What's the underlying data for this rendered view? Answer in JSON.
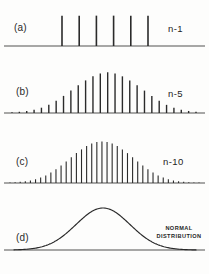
{
  "figure": {
    "background_color": "#fdfdfc",
    "ink_color": "#2a2a2a",
    "baseline_color": "#8a8a8a"
  },
  "panels": [
    {
      "key": "a",
      "label": "(a)",
      "n_label": "n-1",
      "caption": null
    },
    {
      "key": "b",
      "label": "(b)",
      "n_label": "n-5",
      "caption": null
    },
    {
      "key": "c",
      "label": "(c)",
      "n_label": "n-10",
      "caption": null
    },
    {
      "key": "d",
      "label": "(d)",
      "n_label": null,
      "caption_line1": "NORMAL",
      "caption_line2": "DISTRIBUTION"
    }
  ],
  "chart_data": [
    {
      "type": "bar",
      "title": "(a) n-1",
      "panel": "a",
      "xlabel": "",
      "ylabel": "",
      "grid": false,
      "legend": null,
      "axis": {
        "baseline": true,
        "ticks": false,
        "tick_labels": false
      },
      "x": [
        1,
        2,
        3,
        4,
        5,
        6
      ],
      "categories": [
        "1",
        "2",
        "3",
        "4",
        "5",
        "6"
      ],
      "values": [
        1.0,
        1.0,
        1.0,
        1.0,
        1.0,
        1.0
      ],
      "ylim": [
        0,
        1.12
      ],
      "bar_width_px": 1.6,
      "x_start_px": 62,
      "x_end_px": 148,
      "note": "Six equal-height spikes: uniform parent distribution for a single observation"
    },
    {
      "type": "bar",
      "title": "(b) n-5",
      "panel": "b",
      "xlabel": "",
      "ylabel": "",
      "grid": false,
      "legend": null,
      "axis": {
        "baseline": true,
        "ticks": false,
        "tick_labels": false
      },
      "x": [
        1,
        2,
        3,
        4,
        5,
        6,
        7,
        8,
        9,
        10,
        11,
        12,
        13,
        14,
        15,
        16,
        17,
        18,
        19,
        20,
        21,
        22,
        23,
        24,
        25,
        26
      ],
      "values": [
        0.02,
        0.03,
        0.05,
        0.08,
        0.13,
        0.2,
        0.3,
        0.42,
        0.55,
        0.68,
        0.8,
        0.9,
        0.97,
        1.0,
        0.97,
        0.9,
        0.8,
        0.68,
        0.55,
        0.42,
        0.3,
        0.2,
        0.13,
        0.08,
        0.05,
        0.03
      ],
      "ylim": [
        0,
        1.08
      ],
      "bar_width_px": 1.4,
      "x_start_px": 12,
      "x_end_px": 196,
      "note": "Sum of 5 observations: discrete bell-shaped distribution"
    },
    {
      "type": "bar",
      "title": "(c) n-10",
      "panel": "c",
      "xlabel": "",
      "ylabel": "",
      "grid": false,
      "legend": null,
      "axis": {
        "baseline": true,
        "ticks": false,
        "tick_labels": false
      },
      "x": [
        1,
        2,
        3,
        4,
        5,
        6,
        7,
        8,
        9,
        10,
        11,
        12,
        13,
        14,
        15,
        16,
        17,
        18,
        19,
        20,
        21,
        22,
        23,
        24,
        25,
        26,
        27,
        28,
        29,
        30,
        31,
        32,
        33,
        34,
        35,
        36,
        37,
        38
      ],
      "values": [
        0.015,
        0.02,
        0.03,
        0.04,
        0.06,
        0.09,
        0.13,
        0.18,
        0.25,
        0.33,
        0.42,
        0.52,
        0.62,
        0.72,
        0.81,
        0.89,
        0.95,
        0.99,
        1.0,
        0.99,
        0.95,
        0.89,
        0.81,
        0.72,
        0.62,
        0.52,
        0.42,
        0.33,
        0.25,
        0.18,
        0.13,
        0.09,
        0.06,
        0.04,
        0.03,
        0.02,
        0.015,
        0.01
      ],
      "ylim": [
        0,
        1.06
      ],
      "bar_width_px": 1.1,
      "x_start_px": 10,
      "x_end_px": 199,
      "note": "Sum of 10 observations: denser, smoother bell shape approaching normality"
    },
    {
      "type": "line",
      "title": "(d) NORMAL DISTRIBUTION",
      "panel": "d",
      "xlabel": "",
      "ylabel": "",
      "grid": false,
      "legend": null,
      "axis": {
        "baseline": true,
        "ticks": false,
        "tick_labels": false
      },
      "curve": "gaussian",
      "mean_px": 103,
      "sigma_px": 27,
      "peak_height_px": 42,
      "xlim_px": [
        14,
        196
      ],
      "ylim": [
        0,
        1.0
      ],
      "note": "Smooth Gaussian limiting curve"
    }
  ]
}
